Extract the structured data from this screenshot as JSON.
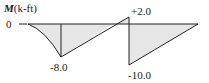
{
  "diagram": {
    "type": "bending-moment-diagram",
    "axis_label_symbol": "M",
    "axis_label_unit": "(k-ft)",
    "zero_label": "0",
    "values": [
      {
        "label": "-8.0",
        "value": -8.0
      },
      {
        "label": "+2.0",
        "value": 2.0
      },
      {
        "label": "-10.0",
        "value": -10.0
      }
    ],
    "colors": {
      "line": "#222222",
      "fill": "#e6e6e6"
    }
  }
}
